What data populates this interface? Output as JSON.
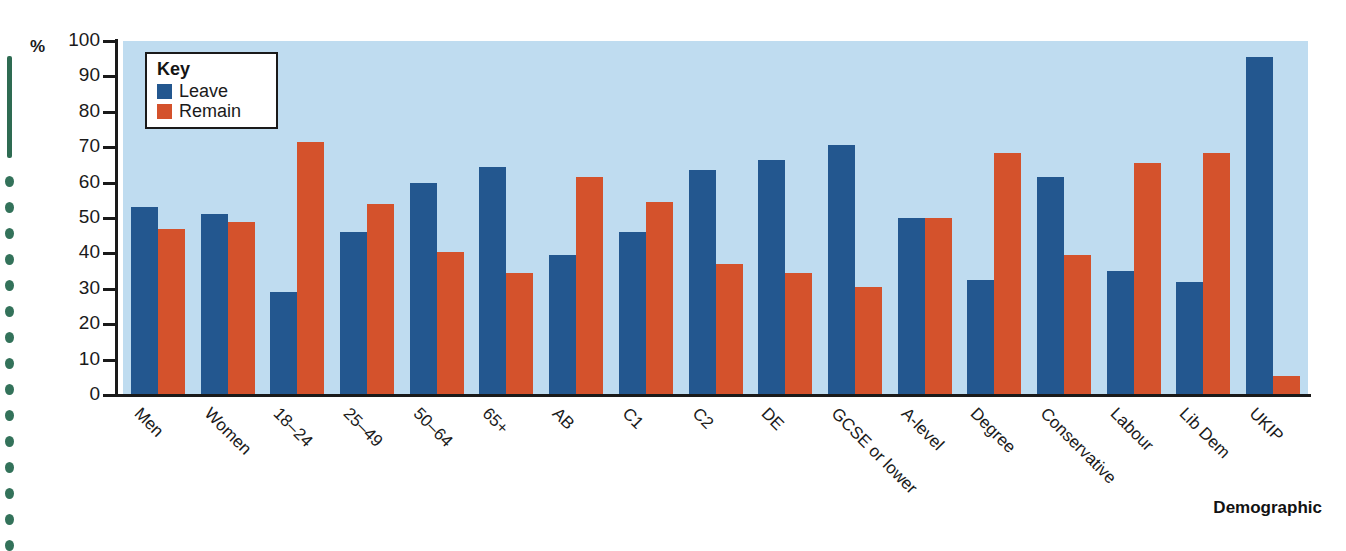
{
  "figure": {
    "y_unit_label": "%",
    "x_axis_title": "Demographic",
    "key_title": "Key"
  },
  "legend": {
    "items": [
      {
        "label": "Leave",
        "color": "#23578f"
      },
      {
        "label": "Remain",
        "color": "#d4522c"
      }
    ]
  },
  "colors": {
    "leave": "#23578f",
    "remain": "#d4522c",
    "plot_background": "#bfdcf0",
    "axis": "#1a1a1a",
    "page_background": "#ffffff",
    "binding": "#33725a"
  },
  "chart_data": {
    "type": "bar",
    "title": "",
    "subtitle": "",
    "xlabel": "Demographic",
    "ylabel": "%",
    "ylim": [
      0,
      100
    ],
    "ytick_values": [
      0,
      10,
      20,
      30,
      40,
      50,
      60,
      70,
      80,
      90,
      100
    ],
    "ytick_labels": [
      "0",
      "10",
      "20",
      "30",
      "40",
      "50",
      "60",
      "70",
      "80",
      "90",
      "100"
    ],
    "grid": false,
    "legend_position": "inside-top-left",
    "legend_entries": [
      "Leave",
      "Remain"
    ],
    "categories": [
      "Men",
      "Women",
      "18–24",
      "25–49",
      "50–64",
      "65+",
      "AB",
      "C1",
      "C2",
      "DE",
      "GCSE or lower",
      "A-level",
      "Degree",
      "Conservative",
      "Labour",
      "Lib Dem",
      "UKIP"
    ],
    "series": [
      {
        "name": "Leave",
        "color": "#23578f",
        "values": [
          53,
          51,
          29,
          46,
          60,
          64.5,
          39.5,
          46,
          63.5,
          66.5,
          70.5,
          50,
          32.5,
          61.5,
          35,
          32,
          95.5
        ]
      },
      {
        "name": "Remain",
        "color": "#d4522c",
        "values": [
          47,
          49,
          71.5,
          54,
          40.5,
          34.5,
          61.5,
          54.5,
          37,
          34.5,
          30.5,
          50,
          68.5,
          39.5,
          65.5,
          68.5,
          5.5
        ]
      }
    ]
  }
}
